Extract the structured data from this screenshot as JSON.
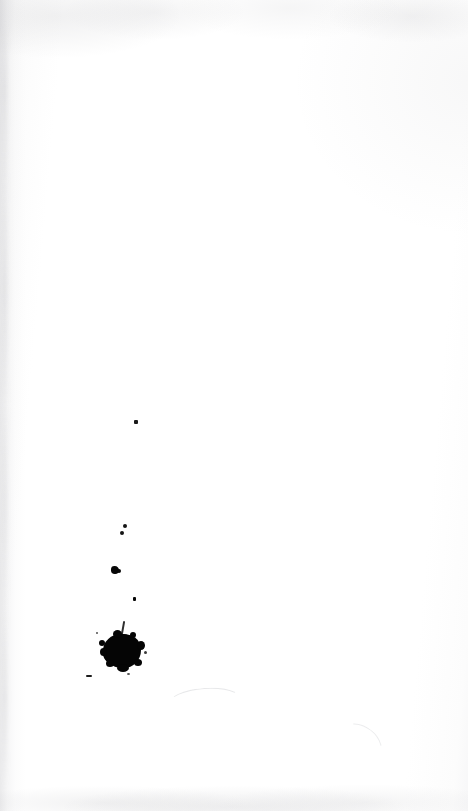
{
  "page": {
    "kind": "scanned-blank-page",
    "width_px": 468,
    "height_px": 811,
    "text_content": "",
    "visible_text_blocks": [],
    "paper_color": "#ffffff",
    "ink_color": "#050505",
    "edge_shadow_color": "#9a9aa0"
  },
  "marks": {
    "main_blot": {
      "name": "ink-blot-main",
      "shape": "irregular-round-splotch",
      "center_x": 122,
      "center_y": 651,
      "width": 38,
      "height": 34,
      "color": "#050505"
    },
    "splatter_trail": [
      {
        "name": "ink-speck-upper",
        "x": 135,
        "y": 422,
        "size": 4,
        "color": "#1a1a1a"
      },
      {
        "name": "ink-speck-pair-top",
        "x": 124,
        "y": 526,
        "size": 4,
        "color": "#141414"
      },
      {
        "name": "ink-speck-pair-bottom",
        "x": 122,
        "y": 533,
        "size": 4,
        "color": "#141414"
      },
      {
        "name": "ink-speck-mid",
        "x": 114,
        "y": 570,
        "size": 8,
        "color": "#050505"
      },
      {
        "name": "ink-speck-lower",
        "x": 134,
        "y": 599,
        "size": 4,
        "color": "#050505"
      },
      {
        "name": "ink-speck-tail",
        "x": 123,
        "y": 626,
        "size": 3,
        "color": "#0b0b0b"
      },
      {
        "name": "ink-dash-left",
        "x": 89,
        "y": 676,
        "size": 6,
        "color": "#1c1c1c"
      }
    ],
    "faint_pencil_arcs": [
      {
        "name": "pencil-arc-left",
        "x": 168,
        "y": 688,
        "width": 72,
        "height": 26
      },
      {
        "name": "pencil-arc-right",
        "x": 336,
        "y": 726,
        "width": 46,
        "height": 34
      }
    ]
  },
  "scan_artifacts": {
    "top_edge_smudge": "faint grey mottling along top margin",
    "bottom_edge_smudge": "faint grey band along bottom margin",
    "left_gutter_streak": "soft vertical grey gradient along left edge"
  }
}
